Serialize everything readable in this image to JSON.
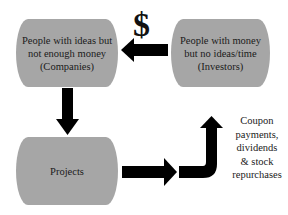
{
  "diagram": {
    "boxes": {
      "companies": {
        "line1": "People with ideas but",
        "line2": "not enough money",
        "line3": "(Companies)"
      },
      "investors": {
        "line1": "People with money",
        "line2": "but no ideas/time",
        "line3": "(Investors)"
      },
      "projects": {
        "label": "Projects"
      }
    },
    "money_symbol": "$",
    "returns_label": {
      "line1": "Coupon",
      "line2": "payments,",
      "line3": "dividends",
      "line4": "& stock",
      "line5": "repurchases"
    },
    "arrows": [
      {
        "from": "investors",
        "to": "companies",
        "direction": "left"
      },
      {
        "from": "companies",
        "to": "projects",
        "direction": "down"
      },
      {
        "from": "projects",
        "to": "returns",
        "direction": "right-then-up"
      }
    ],
    "colors": {
      "box_fill": "#a6a6a6",
      "arrow": "#000000",
      "text": "#1a1a1a"
    }
  }
}
